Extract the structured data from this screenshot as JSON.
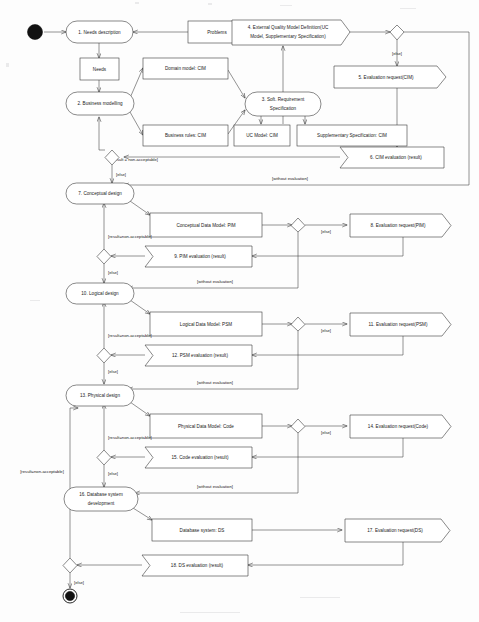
{
  "diagram": {
    "type": "uml-activity-diagram",
    "colors": {
      "stroke": "#3a3a3a",
      "text": "#1a1a1a",
      "fill": "#ffffff",
      "terminal": "#111111"
    },
    "initial_node": "initial-node",
    "final_node": "final-node",
    "actions": [
      {
        "id": "a1",
        "label": "1. Needs description"
      },
      {
        "id": "a2",
        "label": "2. Business modelling"
      },
      {
        "id": "a3",
        "label": "3. Soft. Requirement Specification",
        "line1": "3. Soft. Requirement",
        "line2": "Specification"
      },
      {
        "id": "a7",
        "label": "7. Conceptual design"
      },
      {
        "id": "a10",
        "label": "10. Logical design"
      },
      {
        "id": "a13",
        "label": "13. Physical design"
      },
      {
        "id": "a16",
        "label": "16. Database system development",
        "line1": "16. Database system",
        "line2": "development"
      }
    ],
    "objects": [
      {
        "id": "o_problems",
        "label": "Problems"
      },
      {
        "id": "o_needs",
        "label": "Needs"
      },
      {
        "id": "o_domain",
        "label": "Domain model: CIM"
      },
      {
        "id": "o_rules",
        "label": "Business rules: CIM"
      },
      {
        "id": "o_uc",
        "label": "UC Model: CIM"
      },
      {
        "id": "o_supp",
        "label": "Supplementary Specification: CIM"
      },
      {
        "id": "o_cdm",
        "label": "Conceptual Data Model: PIM"
      },
      {
        "id": "o_ldm",
        "label": "Logical Data Model: PSM"
      },
      {
        "id": "o_pdm",
        "label": "Physical Data Model: Code"
      },
      {
        "id": "o_ds",
        "label": "Database system: DS"
      }
    ],
    "send_signals": [
      {
        "id": "s4",
        "label": "4. External Quality Model Definition(UC Model, Supplementary Specification)",
        "line1": "4. External Quality Model Definition(UC",
        "line2": "Model, Supplementary Specification)"
      },
      {
        "id": "s5",
        "label": "5. Evaluation request(CIM)"
      },
      {
        "id": "s8",
        "label": "8. Evaluation request(PIM)"
      },
      {
        "id": "s11",
        "label": "11. Evaluation request(PSM)"
      },
      {
        "id": "s14",
        "label": "14. Evaluation request(Code)"
      },
      {
        "id": "s17",
        "label": "17. Evaluation request(DS)"
      }
    ],
    "receive_signals": [
      {
        "id": "r6",
        "label": "6. CIM evaluation (result)"
      },
      {
        "id": "r9",
        "label": "9. PIM evaluation (result)"
      },
      {
        "id": "r12",
        "label": "12. PSM evaluation (result)"
      },
      {
        "id": "r15",
        "label": "15. Code evaluation (result)"
      },
      {
        "id": "r18",
        "label": "18. DS evaluation (result)"
      }
    ],
    "guards": {
      "else": "[else]",
      "without_evaluation": "[without evaluation]",
      "result_non_acceptable_spaced": "[result = non-acceptable]",
      "result_non_acceptable": "[result=non-acceptable]"
    },
    "guard_instances": [
      {
        "id": "g_cim_else",
        "text": "[else]"
      },
      {
        "id": "g_cim_result",
        "text": "[result = non-acceptable]"
      },
      {
        "id": "g_cim_else2",
        "text": "[else]"
      },
      {
        "id": "g_cim_without",
        "text": "[without evaluation]"
      },
      {
        "id": "g_pim_else",
        "text": "[else]"
      },
      {
        "id": "g_pim_result",
        "text": "[result=non-acceptable]"
      },
      {
        "id": "g_pim_else2",
        "text": "[else]"
      },
      {
        "id": "g_pim_without",
        "text": "[without evaluation]"
      },
      {
        "id": "g_psm_else",
        "text": "[else]"
      },
      {
        "id": "g_psm_result",
        "text": "[result=non-acceptable]"
      },
      {
        "id": "g_psm_else2",
        "text": "[else]"
      },
      {
        "id": "g_psm_without",
        "text": "[without evaluation]"
      },
      {
        "id": "g_code_else",
        "text": "[else]"
      },
      {
        "id": "g_code_result",
        "text": "[result=non-acceptable]"
      },
      {
        "id": "g_code_else2",
        "text": "[else]"
      },
      {
        "id": "g_code_without",
        "text": "[without evaluation]"
      },
      {
        "id": "g_ds_result",
        "text": "[result=non-acceptable]"
      },
      {
        "id": "g_ds_else",
        "text": "[else]"
      }
    ]
  }
}
